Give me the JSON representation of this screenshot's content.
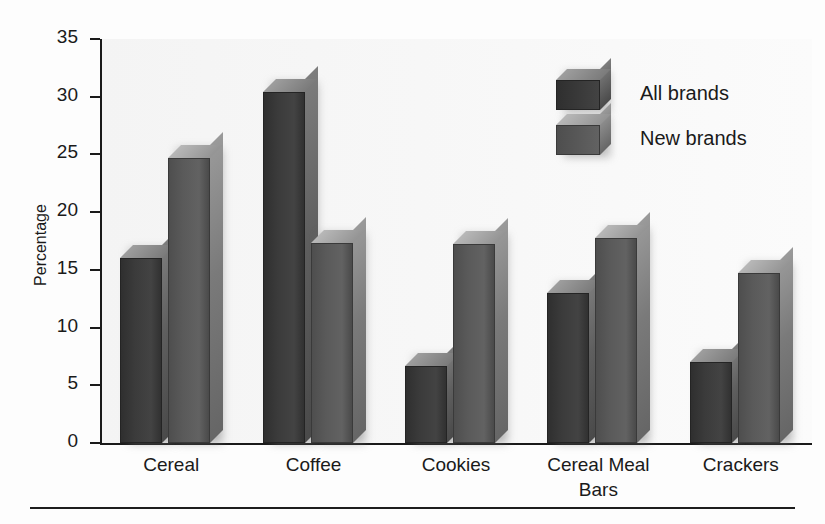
{
  "chart_data": {
    "type": "bar",
    "title": "",
    "xlabel": "",
    "ylabel": "Percentage",
    "ylim": [
      0,
      35
    ],
    "yticks": [
      0,
      5,
      10,
      15,
      20,
      25,
      30,
      35
    ],
    "grid": false,
    "legend_position": "top-right",
    "categories": [
      "Cereal",
      "Coffee",
      "Cookies",
      "Cereal Meal Bars",
      "Crackers"
    ],
    "category_labels": [
      {
        "line1": "Cereal",
        "line2": ""
      },
      {
        "line1": "Coffee",
        "line2": ""
      },
      {
        "line1": "Cookies",
        "line2": ""
      },
      {
        "line1": "Cereal Meal",
        "line2": "Bars"
      },
      {
        "line1": "Crackers",
        "line2": ""
      }
    ],
    "series": [
      {
        "name": "All brands",
        "color": "#3b3b3b",
        "values": [
          16.0,
          30.4,
          6.7,
          13.0,
          7.0
        ]
      },
      {
        "name": "New brands",
        "color": "#5a5a5a",
        "values": [
          24.7,
          17.3,
          17.2,
          17.8,
          14.7
        ]
      }
    ]
  },
  "axis": {
    "y_label": "Percentage",
    "y_tick_labels": [
      "35",
      "30",
      "25",
      "20",
      "15",
      "10",
      "5",
      "0"
    ]
  },
  "legend": {
    "items": [
      {
        "label": "All brands"
      },
      {
        "label": "New brands"
      }
    ]
  }
}
